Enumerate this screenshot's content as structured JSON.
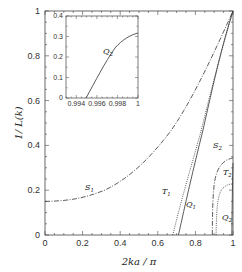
{
  "chart_data": [
    {
      "type": "line",
      "title": "",
      "xlabel": "2ka/π",
      "ylabel": "1/L(k)",
      "xlim": [
        0,
        1
      ],
      "ylim": [
        0,
        1
      ],
      "xticks": [
        "0",
        "0.2",
        "0.4",
        "0.6",
        "0.8",
        "1"
      ],
      "yticks": [
        "0",
        "0.2",
        "0.4",
        "0.6",
        "0.8",
        "1"
      ],
      "grid": false,
      "legend": "none (inline curve labels)",
      "series": [
        {
          "name": "S1",
          "style": "dash-dot",
          "x": [
            0,
            0.1,
            0.2,
            0.3,
            0.4,
            0.5,
            0.6,
            0.7,
            0.8,
            0.9,
            1.0
          ],
          "y": [
            0.15,
            0.16,
            0.19,
            0.24,
            0.31,
            0.4,
            0.51,
            0.63,
            0.76,
            0.89,
            1.0
          ]
        },
        {
          "name": "T1",
          "style": "dotted",
          "x": [
            0.68,
            0.72,
            0.76,
            0.8,
            0.85,
            0.9,
            0.95,
            1.0
          ],
          "y": [
            0.0,
            0.12,
            0.25,
            0.39,
            0.56,
            0.73,
            0.88,
            1.0
          ]
        },
        {
          "name": "Q1",
          "style": "solid",
          "x": [
            0.71,
            0.75,
            0.8,
            0.85,
            0.9,
            0.95,
            1.0
          ],
          "y": [
            0.0,
            0.14,
            0.32,
            0.5,
            0.68,
            0.85,
            1.0
          ]
        },
        {
          "name": "S2",
          "style": "dash-dot",
          "x": [
            0.89,
            0.9,
            0.92,
            0.95,
            0.98,
            1.0
          ],
          "y": [
            0.0,
            0.22,
            0.33,
            0.4,
            0.44,
            0.45
          ]
        },
        {
          "name": "T2",
          "style": "dotted",
          "x": [
            0.91,
            0.92,
            0.94,
            0.96,
            0.98,
            1.0
          ],
          "y": [
            0.0,
            0.17,
            0.26,
            0.32,
            0.35,
            0.36
          ]
        },
        {
          "name": "Q2",
          "style": "solid",
          "x": [
            0.994,
            0.995,
            0.996,
            0.997,
            0.998,
            0.999,
            1.0
          ],
          "y": [
            0.0,
            0.09,
            0.17,
            0.24,
            0.28,
            0.31,
            0.32
          ]
        }
      ],
      "annotations": [
        {
          "text": "S1",
          "x": 0.23,
          "y": 0.21
        },
        {
          "text": "T1",
          "x": 0.64,
          "y": 0.19
        },
        {
          "text": "Q1",
          "x": 0.71,
          "y": 0.12
        },
        {
          "text": "S2",
          "x": 0.89,
          "y": 0.42
        },
        {
          "text": "T2",
          "x": 0.92,
          "y": 0.32
        },
        {
          "text": "Q2",
          "x": 0.92,
          "y": 0.07
        }
      ]
    },
    {
      "type": "line",
      "title": "inset",
      "xlim": [
        0.993,
        1.0
      ],
      "ylim": [
        0,
        0.4
      ],
      "xticks": [
        "0.994",
        "0.996",
        "0.998",
        "1"
      ],
      "yticks": [
        "0",
        "0.1",
        "0.2",
        "0.3",
        "0.4"
      ],
      "series": [
        {
          "name": "Q2",
          "style": "solid",
          "x": [
            0.9945,
            0.995,
            0.996,
            0.997,
            0.998,
            0.999,
            1.0
          ],
          "y": [
            0.0,
            0.04,
            0.12,
            0.19,
            0.25,
            0.29,
            0.31
          ]
        }
      ],
      "annotations": [
        {
          "text": "Q2",
          "x": 0.9965,
          "y": 0.26
        }
      ]
    }
  ],
  "labels": {
    "xlabel": "2ka / π",
    "ylabel": "1/ L(k)",
    "xticks": [
      "0",
      "0.2",
      "0.4",
      "0.6",
      "0.8",
      "1"
    ],
    "yticks": [
      "0",
      "0.2",
      "0.4",
      "0.6",
      "0.8",
      "1"
    ],
    "inset_xticks": [
      "0.994",
      "0.996",
      "0.998",
      "1"
    ],
    "inset_yticks": [
      "0",
      "0.1",
      "0.2",
      "0.3",
      "0.4"
    ],
    "curves": {
      "S": "S",
      "T": "T",
      "Q": "Q",
      "one": "1",
      "two": "2"
    }
  }
}
